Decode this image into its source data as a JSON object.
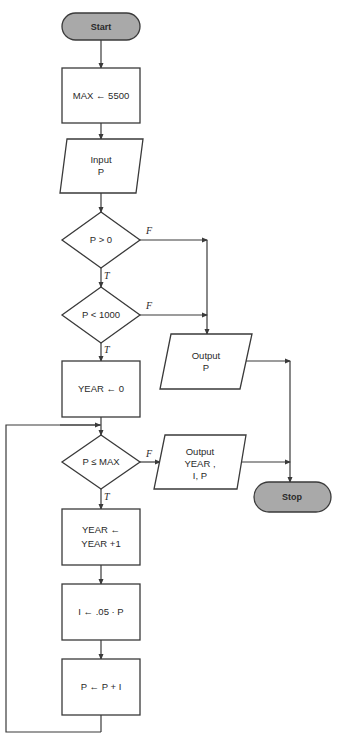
{
  "diagram": {
    "type": "flowchart",
    "nodes": {
      "start": "Start",
      "max_assign": "MAX ← 5500",
      "input_line1": "Input",
      "input_line2": "P",
      "dec_p_gt_0": "P > 0",
      "dec_p_lt_1000": "P < 1000",
      "year_init": "YEAR ← 0",
      "output_p_line1": "Output",
      "output_p_line2": "P",
      "dec_p_le_max": "P ≤ MAX",
      "output_year_line1": "Output",
      "output_year_line2": "YEAR ,",
      "output_year_line3": "I, P",
      "year_inc_line1": "YEAR ←",
      "year_inc_line2": "YEAR +1",
      "interest": "I ← .05 · P",
      "p_update": "P ← P + I",
      "stop": "Stop"
    },
    "edge_labels": {
      "true": "T",
      "false": "F"
    },
    "colors": {
      "terminal_fill": "#a9a9a9",
      "stroke": "#3a3a3a"
    }
  }
}
